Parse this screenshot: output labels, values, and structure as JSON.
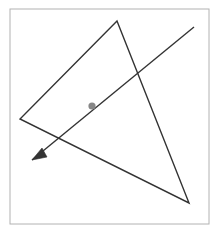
{
  "figure": {
    "canvas": {
      "width": 218,
      "height": 233,
      "background": "#ffffff"
    },
    "frame": {
      "name": "image-border",
      "x": 10,
      "y": 9,
      "width": 199,
      "height": 215,
      "stroke": "#b2b2b2",
      "stroke_width": 1,
      "fill": "none"
    },
    "triangle": {
      "name": "triangle-outline",
      "stroke": "#333333",
      "stroke_width": 1.4,
      "fill": "none",
      "points": "117,21 20,119 189,203",
      "vertices": [
        {
          "label": "apex",
          "x": 117,
          "y": 21
        },
        {
          "label": "left",
          "x": 20,
          "y": 119
        },
        {
          "label": "bottom-right",
          "x": 189,
          "y": 203
        }
      ]
    },
    "arrow": {
      "name": "directed-line",
      "stroke": "#333333",
      "stroke_width": 1.4,
      "start": {
        "x": 194,
        "y": 27
      },
      "end": {
        "x": 32,
        "y": 160
      },
      "head": {
        "name": "arrowhead",
        "points": "32,160 47,157 42,148",
        "fill": "#333333"
      }
    },
    "point": {
      "name": "interior-point",
      "cx": 92,
      "cy": 106,
      "r": 3.6,
      "fill": "#878787",
      "stroke": "none"
    },
    "intersections": [
      {
        "label": "arrow-crosses-right-edge",
        "x": 138,
        "y": 70
      },
      {
        "label": "arrow-crosses-bottom-edge",
        "x": 57,
        "y": 139
      }
    ]
  }
}
